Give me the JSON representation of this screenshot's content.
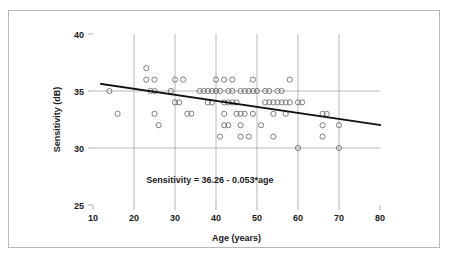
{
  "figure": {
    "border_color": "#b8b8b8",
    "background": "#ffffff"
  },
  "chart_data": {
    "type": "scatter",
    "title": "",
    "xlabel": "Age (years)",
    "ylabel": "Sensitivity (dB)",
    "xlim": [
      10,
      80
    ],
    "ylim": [
      25,
      40
    ],
    "xticks": [
      10,
      20,
      30,
      40,
      50,
      60,
      70,
      80
    ],
    "xtick_labels": [
      "10",
      "20",
      "30",
      "40",
      "50",
      "60",
      "70",
      "80"
    ],
    "yticks": [
      25,
      30,
      35,
      40
    ],
    "ytick_labels": [
      "25",
      "30",
      "35",
      "40"
    ],
    "grid": "both",
    "grid_x_values": [
      20,
      30,
      40,
      50,
      60,
      70
    ],
    "grid_y_values": [
      30,
      35
    ],
    "legend": "none",
    "marker": "open-circle",
    "marker_color": "#6e6e6e",
    "annotations": [
      {
        "text": "Sensitivity = 36.26 - 0.053*age",
        "x": 23,
        "y": 26.9
      }
    ],
    "regression": {
      "label": "Sensitivity = 36.26 - 0.053*age",
      "intercept": 36.26,
      "slope": -0.053,
      "x_start": 12,
      "x_end": 80,
      "y_start": 35.62,
      "y_end": 32.02,
      "color": "#111111"
    },
    "points": [
      {
        "x": 14,
        "y": 35
      },
      {
        "x": 16,
        "y": 33
      },
      {
        "x": 23,
        "y": 37
      },
      {
        "x": 23,
        "y": 36
      },
      {
        "x": 25,
        "y": 36
      },
      {
        "x": 24,
        "y": 35
      },
      {
        "x": 25,
        "y": 35
      },
      {
        "x": 25,
        "y": 33
      },
      {
        "x": 26,
        "y": 32
      },
      {
        "x": 30,
        "y": 36
      },
      {
        "x": 32,
        "y": 36
      },
      {
        "x": 29,
        "y": 35
      },
      {
        "x": 30,
        "y": 34
      },
      {
        "x": 31,
        "y": 34
      },
      {
        "x": 33,
        "y": 33
      },
      {
        "x": 34,
        "y": 33
      },
      {
        "x": 36,
        "y": 35
      },
      {
        "x": 37,
        "y": 35
      },
      {
        "x": 38,
        "y": 35
      },
      {
        "x": 40,
        "y": 36
      },
      {
        "x": 42,
        "y": 36
      },
      {
        "x": 44,
        "y": 36
      },
      {
        "x": 49,
        "y": 36
      },
      {
        "x": 58,
        "y": 36
      },
      {
        "x": 39,
        "y": 35
      },
      {
        "x": 40,
        "y": 35
      },
      {
        "x": 41,
        "y": 35
      },
      {
        "x": 43,
        "y": 35
      },
      {
        "x": 44,
        "y": 35
      },
      {
        "x": 46,
        "y": 35
      },
      {
        "x": 47,
        "y": 35
      },
      {
        "x": 48,
        "y": 35
      },
      {
        "x": 49,
        "y": 35
      },
      {
        "x": 50,
        "y": 35
      },
      {
        "x": 52,
        "y": 35
      },
      {
        "x": 53,
        "y": 35
      },
      {
        "x": 55,
        "y": 35
      },
      {
        "x": 56,
        "y": 35
      },
      {
        "x": 38,
        "y": 34
      },
      {
        "x": 39,
        "y": 34
      },
      {
        "x": 42,
        "y": 34
      },
      {
        "x": 43,
        "y": 34
      },
      {
        "x": 44,
        "y": 34
      },
      {
        "x": 45,
        "y": 34
      },
      {
        "x": 52,
        "y": 34
      },
      {
        "x": 53,
        "y": 34
      },
      {
        "x": 54,
        "y": 34
      },
      {
        "x": 55,
        "y": 34
      },
      {
        "x": 56,
        "y": 34
      },
      {
        "x": 57,
        "y": 34
      },
      {
        "x": 58,
        "y": 34
      },
      {
        "x": 60,
        "y": 34
      },
      {
        "x": 61,
        "y": 34
      },
      {
        "x": 42,
        "y": 33
      },
      {
        "x": 45,
        "y": 33
      },
      {
        "x": 46,
        "y": 33
      },
      {
        "x": 47,
        "y": 33
      },
      {
        "x": 49,
        "y": 33
      },
      {
        "x": 54,
        "y": 33
      },
      {
        "x": 57,
        "y": 33
      },
      {
        "x": 66,
        "y": 33
      },
      {
        "x": 67,
        "y": 33
      },
      {
        "x": 42,
        "y": 32
      },
      {
        "x": 43,
        "y": 32
      },
      {
        "x": 46,
        "y": 32
      },
      {
        "x": 51,
        "y": 32
      },
      {
        "x": 66,
        "y": 32
      },
      {
        "x": 70,
        "y": 32
      },
      {
        "x": 41,
        "y": 31
      },
      {
        "x": 46,
        "y": 31
      },
      {
        "x": 48,
        "y": 31
      },
      {
        "x": 54,
        "y": 31
      },
      {
        "x": 66,
        "y": 31
      },
      {
        "x": 60,
        "y": 30
      },
      {
        "x": 70,
        "y": 30
      }
    ]
  }
}
